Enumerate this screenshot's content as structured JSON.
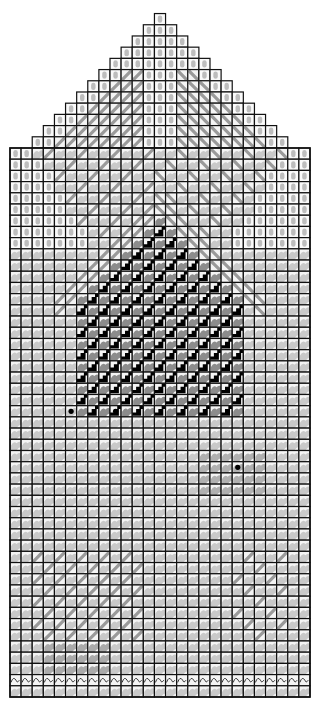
{
  "diagram": {
    "type": "knitting-chart",
    "grid": {
      "left": 10,
      "right": 310,
      "cols": 27,
      "body_top": 148,
      "bottom": 697,
      "body_rows": 49,
      "apex_top": 8,
      "cell": 11.11
    },
    "colors": {
      "background": "#ffffff",
      "grid_line": "#111111",
      "light_cell": "#f4f4f4",
      "blob": "#c9c9c9",
      "blob_dark": "#8c8c8c",
      "stripe": "#9a9a9a",
      "black_cell": "#000000",
      "dot": "#000000"
    },
    "symbols": [
      {
        "name": "vertical-bar-stitch",
        "region": "top-triangle"
      },
      {
        "name": "diagonal-slash-stitch",
        "region": "roof-band"
      },
      {
        "name": "knit-blob-stitch",
        "region": "background"
      },
      {
        "name": "black-purl-stitch",
        "region": "house-body"
      },
      {
        "name": "dot-marker",
        "region": "windows"
      },
      {
        "name": "curl-edge-stitch",
        "region": "cuff-row"
      }
    ],
    "dots": [
      {
        "col": 5,
        "row": 23
      },
      {
        "col": 9,
        "row": 23
      },
      {
        "col": 20,
        "row": 28
      }
    ]
  }
}
